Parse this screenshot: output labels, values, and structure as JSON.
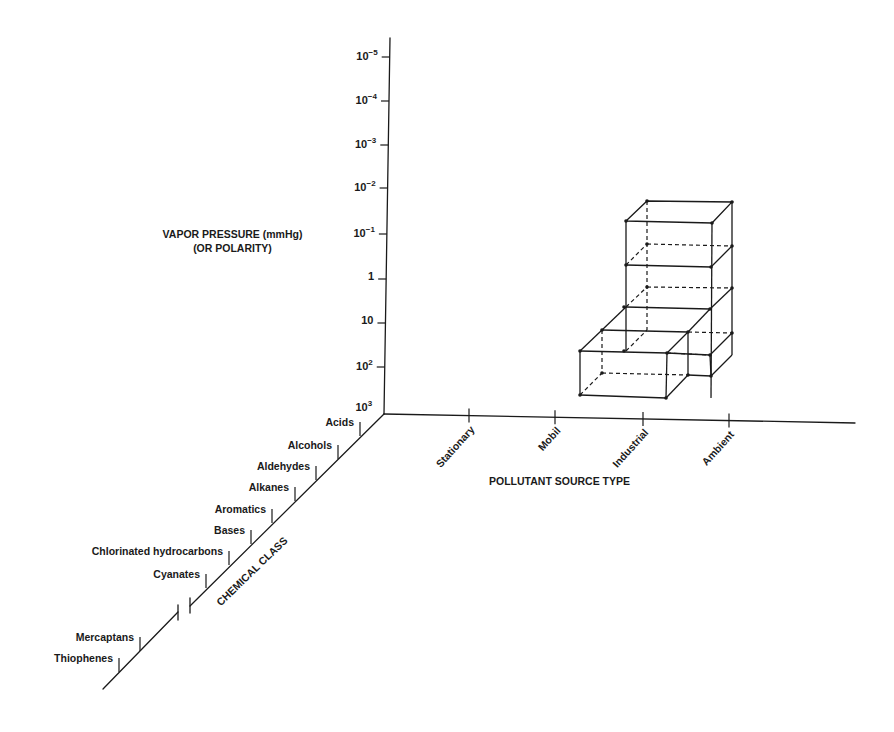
{
  "figure": {
    "type": "3d-axis-schematic",
    "vertical_axis": {
      "title_line1": "VAPOR PRESSURE (mmHg)",
      "title_line2": "(OR POLARITY)",
      "ticks": [
        {
          "base": "10",
          "exp": "−5",
          "y": 57
        },
        {
          "base": "10",
          "exp": "−4",
          "y": 101
        },
        {
          "base": "10",
          "exp": "−3",
          "y": 145
        },
        {
          "base": "10",
          "exp": "−2",
          "y": 188
        },
        {
          "base": "10",
          "exp": "−1",
          "y": 234
        },
        {
          "base": "1",
          "exp": "",
          "y": 279
        },
        {
          "base": "10",
          "exp": "",
          "y": 323
        },
        {
          "base": "10",
          "exp": "2",
          "y": 367
        },
        {
          "base": "10",
          "exp": "3",
          "y": 408
        }
      ]
    },
    "horizontal_axis": {
      "title": "POLLUTANT SOURCE TYPE",
      "categories": [
        {
          "label": "Stationary",
          "x": 469
        },
        {
          "label": "Mobil",
          "x": 555
        },
        {
          "label": "Industrial",
          "x": 643
        },
        {
          "label": "Ambient",
          "x": 729
        }
      ]
    },
    "depth_axis": {
      "title": "CHEMICAL CLASS",
      "categories": [
        {
          "label": "Acids",
          "tx": 360,
          "ty": 422
        },
        {
          "label": "Alcohols",
          "tx": 338,
          "ty": 445
        },
        {
          "label": "Aldehydes",
          "tx": 316,
          "ty": 466
        },
        {
          "label": "Alkanes",
          "tx": 295,
          "ty": 487
        },
        {
          "label": "Aromatics",
          "tx": 272,
          "ty": 509
        },
        {
          "label": "Bases",
          "tx": 251,
          "ty": 530
        },
        {
          "label": "Chlorinated hydrocarbons",
          "tx": 229,
          "ty": 551
        },
        {
          "label": "Cyanates",
          "tx": 206,
          "ty": 574
        },
        {
          "label": "Mercaptans",
          "tx": 140,
          "ty": 637
        },
        {
          "label": "Thiophenes",
          "tx": 119,
          "ty": 658
        }
      ],
      "axis_break": true
    },
    "stacked_blocks": {
      "description": "Wireframe stack of three unit boxes over Industrial/Ambient with a lower front box over Mobil–Industrial",
      "tiers": 3
    }
  },
  "colors": {
    "ink": "#1a1a1a",
    "background": "#ffffff"
  }
}
